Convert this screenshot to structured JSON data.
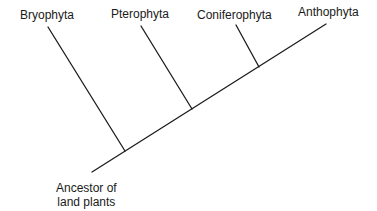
{
  "diagram": {
    "type": "cladogram",
    "taxa": [
      {
        "label": "Bryophyta"
      },
      {
        "label": "Pterophyta"
      },
      {
        "label": "Coniferophyta"
      },
      {
        "label": "Anthophyta"
      }
    ],
    "root": {
      "line1": "Ancestor of",
      "line2": "land plants"
    },
    "line_color": "#1c1c1c"
  }
}
